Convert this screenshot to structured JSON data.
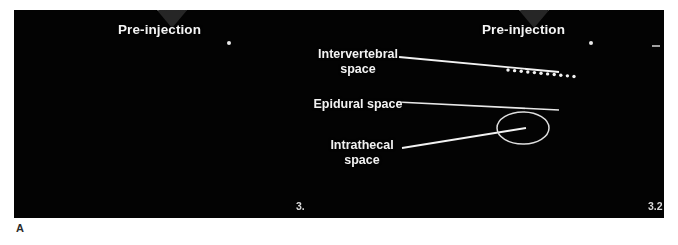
{
  "figure": {
    "panel_letter": "A",
    "background_color": "#ffffff",
    "panel_background_color": "#030303",
    "annotation_color": "#f2f2f2"
  },
  "scans": [
    {
      "id": "left-scan",
      "title": "Pre-injection",
      "corner_number": "3.",
      "marker_dot": true
    },
    {
      "id": "right-scan",
      "title": "Pre-injection",
      "corner_number": "3.2",
      "marker_dot": true,
      "caliper_dots": true,
      "ellipse_marker": true
    }
  ],
  "annotations": [
    {
      "id": "intervertebral",
      "label": "Intervertebral\nspace",
      "name": "annotation-intervertebral-space"
    },
    {
      "id": "epidural",
      "label": "Epidural space",
      "name": "annotation-epidural-space"
    },
    {
      "id": "intrathecal",
      "label": "Intrathecal\nspace",
      "name": "annotation-intrathecal-space"
    }
  ]
}
